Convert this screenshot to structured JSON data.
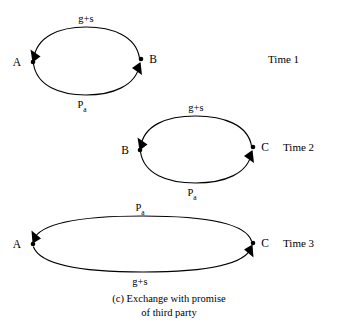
{
  "figure": {
    "caption_line1": "(c) Exchange with promise",
    "caption_line2": "of third party"
  },
  "diagram": {
    "type": "exchange-cycle-diagram",
    "stages": [
      {
        "id": "time-1",
        "time_label": "Time 1",
        "left_node": "A",
        "right_node": "B",
        "top_label_main": "g+s",
        "top_label_sub": "",
        "top_direction": "right-to-left",
        "bottom_label_main": "P",
        "bottom_label_sub": "a",
        "bottom_direction": "left-to-right"
      },
      {
        "id": "time-2",
        "time_label": "Time 2",
        "left_node": "B",
        "right_node": "C",
        "top_label_main": "g+s",
        "top_label_sub": "",
        "top_direction": "right-to-left",
        "bottom_label_main": "P",
        "bottom_label_sub": "a",
        "bottom_direction": "left-to-right"
      },
      {
        "id": "time-3",
        "time_label": "Time 3",
        "left_node": "A",
        "right_node": "C",
        "top_label_main": "P",
        "top_label_sub": "a",
        "top_direction": "right-to-left",
        "bottom_label_main": "g+s",
        "bottom_label_sub": "",
        "bottom_direction": "left-to-right"
      }
    ]
  },
  "colors": {
    "background": "#ffffff",
    "ink": "#000000"
  }
}
